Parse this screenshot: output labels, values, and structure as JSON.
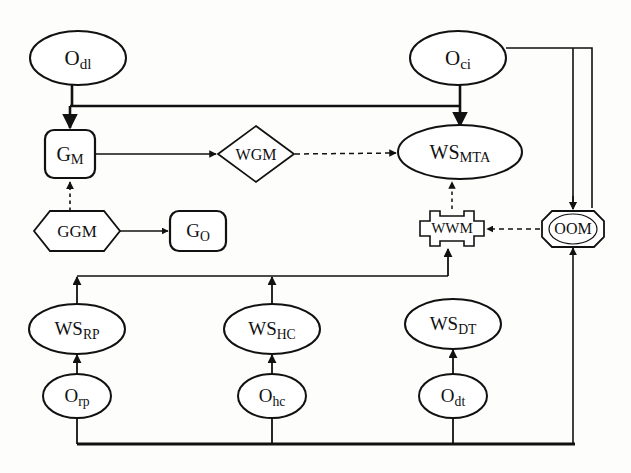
{
  "diagram": {
    "stroke_color": "#111111",
    "background_color": "#fdfdfc",
    "nodes": [
      {
        "id": "Odl",
        "shape": "ellipse",
        "base": "O",
        "sub": "dl",
        "label": "Odl",
        "cx": 78,
        "cy": 58,
        "rx": 48,
        "ry": 27
      },
      {
        "id": "Oci",
        "shape": "ellipse",
        "base": "O",
        "sub": "ci",
        "label": "Oci",
        "cx": 458,
        "cy": 58,
        "rx": 48,
        "ry": 27
      },
      {
        "id": "GM",
        "shape": "round-rect",
        "base": "G",
        "sub": "M",
        "label": "GM",
        "cx": 70,
        "cy": 154,
        "w": 50,
        "h": 48
      },
      {
        "id": "WGM",
        "shape": "diamond",
        "base": "WGM",
        "sub": "",
        "label": "WGM",
        "cx": 256,
        "cy": 154,
        "w": 76,
        "h": 56
      },
      {
        "id": "WSMTA",
        "shape": "ellipse",
        "base": "WS",
        "sub": "MTA",
        "label": "WSMTA",
        "cx": 460,
        "cy": 152,
        "rx": 62,
        "ry": 27
      },
      {
        "id": "GGM",
        "shape": "hexagon",
        "base": "GGM",
        "sub": "",
        "label": "GGM",
        "cx": 77,
        "cy": 231,
        "w": 82,
        "h": 40
      },
      {
        "id": "GO",
        "shape": "round-rect",
        "base": "G",
        "sub": "O",
        "label": "GO",
        "cx": 198,
        "cy": 231,
        "w": 56,
        "h": 40
      },
      {
        "id": "WWM",
        "shape": "notched-rect",
        "base": "WWM",
        "sub": "",
        "label": "WWM",
        "cx": 452,
        "cy": 228,
        "w": 58,
        "h": 34
      },
      {
        "id": "OOM",
        "shape": "octagon",
        "base": "OOM",
        "sub": "",
        "label": "OOM",
        "cx": 573,
        "cy": 228,
        "w": 62,
        "h": 34
      },
      {
        "id": "WSRP",
        "shape": "ellipse",
        "base": "WS",
        "sub": "RP",
        "label": "WSRP",
        "cx": 77,
        "cy": 328,
        "rx": 48,
        "ry": 24
      },
      {
        "id": "WSHC",
        "shape": "ellipse",
        "base": "WS",
        "sub": "HC",
        "label": "WSHC",
        "cx": 272,
        "cy": 328,
        "rx": 48,
        "ry": 24
      },
      {
        "id": "WSDT",
        "shape": "ellipse",
        "base": "WS",
        "sub": "DT",
        "label": "WSDT",
        "cx": 453,
        "cy": 323,
        "rx": 48,
        "ry": 24
      },
      {
        "id": "Orp",
        "shape": "ellipse",
        "base": "O",
        "sub": "rp",
        "label": "Orp",
        "cx": 77,
        "cy": 396,
        "rx": 34,
        "ry": 22
      },
      {
        "id": "Ohc",
        "shape": "ellipse",
        "base": "O",
        "sub": "hc",
        "label": "Ohc",
        "cx": 272,
        "cy": 396,
        "rx": 34,
        "ry": 22
      },
      {
        "id": "Odt",
        "shape": "ellipse",
        "base": "O",
        "sub": "dt",
        "label": "Odt",
        "cx": 453,
        "cy": 396,
        "rx": 34,
        "ry": 22
      }
    ],
    "edges": [
      {
        "id": "e-odl-bus",
        "from": "Odl",
        "to": "bus-top",
        "style": "solid",
        "arrow": false
      },
      {
        "id": "e-bus-gm",
        "from": "bus-top",
        "to": "GM",
        "style": "solid",
        "arrow": true
      },
      {
        "id": "e-oci-bus",
        "from": "Oci",
        "to": "bus-top",
        "style": "solid",
        "arrow": false
      },
      {
        "id": "e-bus-wsmta",
        "from": "bus-top",
        "to": "WSMTA",
        "style": "solid",
        "arrow": true
      },
      {
        "id": "e-gm-wgm",
        "from": "GM",
        "to": "WGM",
        "style": "solid",
        "arrow": true
      },
      {
        "id": "e-wgm-wsmta",
        "from": "WGM",
        "to": "WSMTA",
        "style": "dashed",
        "arrow": true
      },
      {
        "id": "e-ggm-gm",
        "from": "GGM",
        "to": "GM",
        "style": "dashed",
        "arrow": true
      },
      {
        "id": "e-ggm-go",
        "from": "GGM",
        "to": "GO",
        "style": "solid",
        "arrow": true
      },
      {
        "id": "e-wwm-wsmta",
        "from": "WWM",
        "to": "WSMTA",
        "style": "dashed",
        "arrow": true
      },
      {
        "id": "e-oom-wwm",
        "from": "OOM",
        "to": "WWM",
        "style": "dashed",
        "arrow": true
      },
      {
        "id": "e-oci-oom",
        "from": "Oci",
        "to": "OOM",
        "style": "solid",
        "arrow": true
      },
      {
        "id": "e-midbus-wwm",
        "from": "bus-mid",
        "to": "WWM",
        "style": "solid",
        "arrow": true
      },
      {
        "id": "e-wsrp-midbus",
        "from": "WSRP",
        "to": "bus-mid",
        "style": "solid",
        "arrow": true
      },
      {
        "id": "e-wshc-midbus",
        "from": "WSHC",
        "to": "bus-mid",
        "style": "solid",
        "arrow": true
      },
      {
        "id": "e-orp-wsrp",
        "from": "Orp",
        "to": "WSRP",
        "style": "solid",
        "arrow": true
      },
      {
        "id": "e-ohc-wshc",
        "from": "Ohc",
        "to": "WSHC",
        "style": "solid",
        "arrow": true
      },
      {
        "id": "e-odt-wsdt",
        "from": "Odt",
        "to": "WSDT",
        "style": "solid",
        "arrow": true
      },
      {
        "id": "e-orp-bot",
        "from": "Orp",
        "to": "bus-bot",
        "style": "solid",
        "arrow": false
      },
      {
        "id": "e-ohc-bot",
        "from": "Ohc",
        "to": "bus-bot",
        "style": "solid",
        "arrow": false
      },
      {
        "id": "e-odt-bot",
        "from": "Odt",
        "to": "bus-bot",
        "style": "solid",
        "arrow": false
      },
      {
        "id": "e-bot-oom",
        "from": "bus-bot",
        "to": "OOM",
        "style": "solid",
        "arrow": true
      }
    ],
    "buses": [
      {
        "id": "bus-top",
        "label": "top-bus",
        "y": 106,
        "x1": 70,
        "x2": 460
      },
      {
        "id": "bus-mid",
        "label": "middle-bus",
        "y": 276,
        "x1": 77,
        "x2": 448
      },
      {
        "id": "bus-bot",
        "label": "bottom-bus",
        "y": 444,
        "x1": 77,
        "x2": 573
      }
    ]
  }
}
